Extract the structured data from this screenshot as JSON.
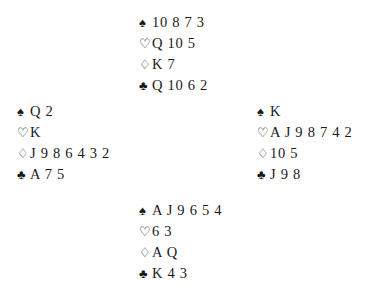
{
  "diagram": {
    "type": "bridge-deal",
    "suit_symbols": {
      "spades": "♠",
      "hearts": "♡",
      "diamonds": "♢",
      "clubs": "♣"
    },
    "colors": {
      "ink": "#1a1a1a",
      "background": "#ffffff"
    },
    "hands": {
      "north": {
        "spades": "10 8 7 3",
        "hearts": "Q 10 5",
        "diamonds": "K 7",
        "clubs": "Q 10 6 2"
      },
      "west": {
        "spades": "Q 2",
        "hearts": "K",
        "diamonds": "J 9 8 6 4 3 2",
        "clubs": "A 7 5"
      },
      "east": {
        "spades": "K",
        "hearts": "A J 9 8 7 4 2",
        "diamonds": "10 5",
        "clubs": "J 9 8"
      },
      "south": {
        "spades": "A J 9 6 5 4",
        "hearts": "6 3",
        "diamonds": "A Q",
        "clubs": "K 4 3"
      }
    }
  }
}
